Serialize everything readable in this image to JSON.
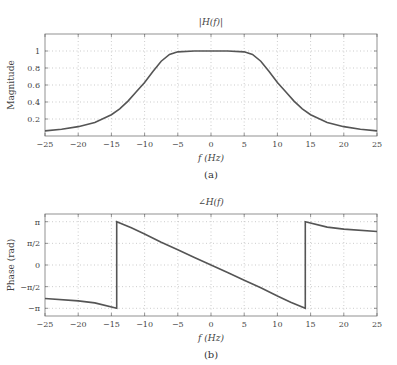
{
  "chart_data": [
    {
      "type": "line",
      "title": "|H(f)|",
      "xlabel": "f (Hz)",
      "ylabel": "Magnitude",
      "caption": "(a)",
      "xlim": [
        -25,
        25
      ],
      "ylim": [
        0,
        1.2
      ],
      "grid": true,
      "xticks": [
        -25,
        -20,
        -15,
        -10,
        -5,
        0,
        5,
        10,
        15,
        20,
        25
      ],
      "xtick_labels": [
        "−25",
        "−20",
        "−15",
        "−10",
        "−5",
        "0",
        "5",
        "10",
        "15",
        "20",
        "25"
      ],
      "yticks": [
        0.2,
        0.4,
        0.6,
        0.8,
        1.0
      ],
      "ytick_labels": [
        "0.2",
        "0.4",
        "0.6",
        "0.8",
        "1"
      ],
      "series": [
        {
          "name": "|H(f)|",
          "x": [
            -25,
            -22.5,
            -20,
            -17.5,
            -15,
            -13.75,
            -12.5,
            -11.25,
            -10,
            -8.75,
            -7.5,
            -6.25,
            -5,
            -2.5,
            0,
            2.5,
            5,
            6.25,
            7.5,
            8.75,
            10,
            11.25,
            12.5,
            13.75,
            15,
            17.5,
            20,
            22.5,
            25
          ],
          "y": [
            0.06,
            0.08,
            0.11,
            0.16,
            0.25,
            0.32,
            0.41,
            0.52,
            0.63,
            0.76,
            0.88,
            0.96,
            0.99,
            1.0,
            1.0,
            1.0,
            0.99,
            0.96,
            0.88,
            0.76,
            0.63,
            0.52,
            0.41,
            0.32,
            0.25,
            0.16,
            0.11,
            0.08,
            0.06
          ]
        }
      ]
    },
    {
      "type": "line",
      "title": "∠H(f)",
      "xlabel": "f (Hz)",
      "ylabel": "Phase (rad)",
      "caption": "(b)",
      "xlim": [
        -25,
        25
      ],
      "ylim": [
        -3.7,
        3.7
      ],
      "grid": true,
      "xticks": [
        -25,
        -20,
        -15,
        -10,
        -5,
        0,
        5,
        10,
        15,
        20,
        25
      ],
      "xtick_labels": [
        "−25",
        "−20",
        "−15",
        "−10",
        "−5",
        "0",
        "5",
        "10",
        "15",
        "20",
        "25"
      ],
      "yticks": [
        -3.1416,
        -1.5708,
        0,
        1.5708,
        3.1416
      ],
      "ytick_labels": [
        "−π",
        "−π/2",
        "0",
        "π/2",
        "π"
      ],
      "series": [
        {
          "name": "∠H(f)",
          "x": [
            -25,
            -20,
            -17.5,
            -14.2,
            -14.2,
            -12,
            -10,
            -7.5,
            -5,
            -2.5,
            0,
            2.5,
            5,
            7.5,
            10,
            12,
            14.2,
            14.2,
            17.5,
            20,
            25
          ],
          "y": [
            -2.43,
            -2.6,
            -2.75,
            -3.1416,
            3.1416,
            2.7,
            2.25,
            1.65,
            1.1,
            0.55,
            0,
            -0.55,
            -1.1,
            -1.65,
            -2.25,
            -2.7,
            -3.1416,
            3.1416,
            2.75,
            2.6,
            2.43
          ]
        }
      ]
    }
  ]
}
